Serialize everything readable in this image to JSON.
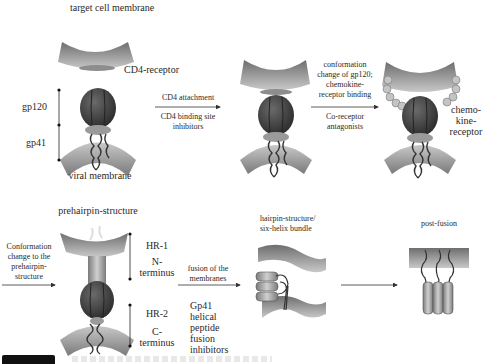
{
  "stages": {
    "initial": {
      "target_membrane_label": "target cell membrane",
      "receptor_label": "CD4-receptor",
      "gp120_label": "gp120",
      "gp41_label": "gp41",
      "viral_membrane_label": "viral membrane"
    },
    "step1": {
      "arrow_label": "CD4 attachment",
      "inhibitor_label": "CD4 binding site inhibitors"
    },
    "step2": {
      "arrow_label_lines": [
        "conformation",
        "change of gp120;",
        "chemokine-",
        "receptor binding"
      ],
      "inhibitor_label_lines": [
        "Co-receptor",
        "antagonists"
      ],
      "coreceptor_label_lines": [
        "chemo-",
        "kine-",
        "receptor"
      ]
    },
    "step3": {
      "entry_arrow_label_lines": [
        "Conformation",
        "change to the",
        "prehairpin-",
        "structure"
      ],
      "title": "prehairpin-structure",
      "hr1_label": "HR-1",
      "n_terminus_lines": [
        "N-",
        "terminus"
      ],
      "hr2_label": "HR-2",
      "c_terminus_lines": [
        "C-",
        "terminus"
      ]
    },
    "step4": {
      "arrow_label_lines": [
        "fusion of the",
        "membranes"
      ],
      "inhibitor_label_lines": [
        "Gp41",
        "helical",
        "peptide",
        "fusion",
        "inhibitors"
      ],
      "title_lines": [
        "hairpin-structure/",
        "six-helix bundle"
      ]
    },
    "step5": {
      "title": "post-fusion"
    }
  },
  "colors": {
    "membrane": "#8a8a8a",
    "membrane_light": "#c9c9c9",
    "gp120": "#3d3d3d",
    "gp41": "#9a9a9a",
    "coreceptor_bead": "#bdbdbd",
    "text": "#2a2a2a"
  }
}
